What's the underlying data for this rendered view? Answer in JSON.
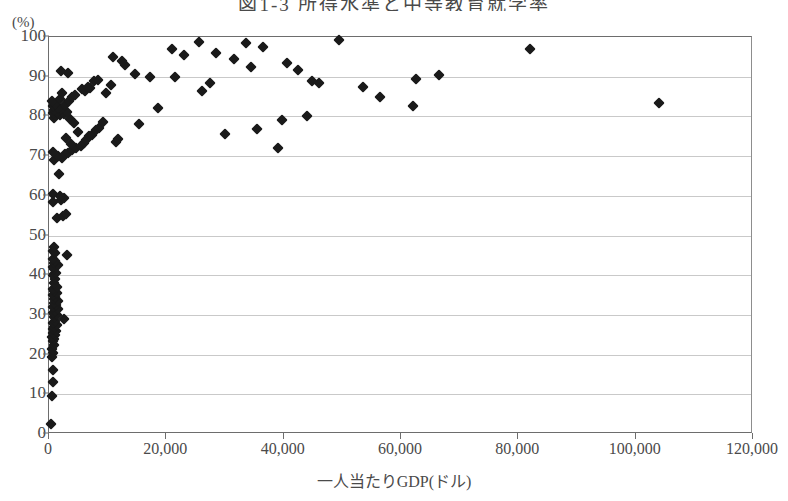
{
  "chart_data": {
    "type": "scatter",
    "title": "図1-3 所得水準と中等教育就学率",
    "xlabel": "一人当たりGDP(ドル)",
    "ylabel": "",
    "y_unit_label": "(%)",
    "xlim": [
      0,
      120000
    ],
    "ylim": [
      0,
      100
    ],
    "xticks": [
      0,
      20000,
      40000,
      60000,
      80000,
      100000,
      120000
    ],
    "xticklabels": [
      "0",
      "20,000",
      "40,000",
      "60,000",
      "80,000",
      "100,000",
      "120,000"
    ],
    "yticks": [
      0,
      10,
      20,
      30,
      40,
      50,
      60,
      70,
      80,
      90,
      100
    ],
    "yticklabels": [
      "0",
      "10",
      "20",
      "30",
      "40",
      "50",
      "60",
      "70",
      "80",
      "90",
      "100"
    ],
    "grid": "horizontal",
    "legend": "none",
    "marker": "diamond",
    "marker_color": "#1a1a1a",
    "gridline_color": "#c9c9c9",
    "axis_color": "#6d6d6d",
    "background_color": "#ffffff",
    "points": [
      [
        400,
        2.5
      ],
      [
        500,
        9.5
      ],
      [
        600,
        13.0
      ],
      [
        700,
        16.0
      ],
      [
        500,
        19.5
      ],
      [
        700,
        20.5
      ],
      [
        500,
        21.5
      ],
      [
        900,
        22.5
      ],
      [
        600,
        23.5
      ],
      [
        800,
        24.0
      ],
      [
        500,
        24.5
      ],
      [
        1000,
        25.0
      ],
      [
        700,
        25.5
      ],
      [
        1200,
        26.0
      ],
      [
        600,
        26.5
      ],
      [
        900,
        27.0
      ],
      [
        1400,
        27.5
      ],
      [
        700,
        28.0
      ],
      [
        1100,
        28.5
      ],
      [
        2600,
        29.0
      ],
      [
        800,
        29.5
      ],
      [
        1300,
        30.0
      ],
      [
        600,
        30.5
      ],
      [
        1000,
        31.0
      ],
      [
        1500,
        31.5
      ],
      [
        700,
        32.0
      ],
      [
        1200,
        32.5
      ],
      [
        900,
        33.0
      ],
      [
        1600,
        33.5
      ],
      [
        800,
        34.0
      ],
      [
        1100,
        34.5
      ],
      [
        600,
        35.0
      ],
      [
        1300,
        35.5
      ],
      [
        900,
        36.0
      ],
      [
        700,
        36.5
      ],
      [
        1400,
        37.0
      ],
      [
        800,
        38.0
      ],
      [
        1000,
        39.0
      ],
      [
        600,
        40.0
      ],
      [
        1200,
        40.5
      ],
      [
        900,
        41.5
      ],
      [
        700,
        42.0
      ],
      [
        1500,
        42.5
      ],
      [
        800,
        43.0
      ],
      [
        1100,
        43.5
      ],
      [
        600,
        44.0
      ],
      [
        3000,
        45.0
      ],
      [
        1000,
        45.5
      ],
      [
        700,
        46.0
      ],
      [
        900,
        47.0
      ],
      [
        1400,
        54.5
      ],
      [
        2400,
        55.0
      ],
      [
        2900,
        55.5
      ],
      [
        700,
        58.5
      ],
      [
        2000,
        59.0
      ],
      [
        2500,
        59.5
      ],
      [
        1800,
        60.0
      ],
      [
        600,
        60.5
      ],
      [
        1700,
        65.5
      ],
      [
        900,
        69.0
      ],
      [
        2200,
        69.5
      ],
      [
        1500,
        70.0
      ],
      [
        2700,
        70.5
      ],
      [
        3300,
        70.8
      ],
      [
        700,
        71.0
      ],
      [
        4000,
        71.5
      ],
      [
        4600,
        72.0
      ],
      [
        39000,
        72.0
      ],
      [
        5400,
        72.5
      ],
      [
        3700,
        73.0
      ],
      [
        5900,
        73.2
      ],
      [
        11400,
        73.5
      ],
      [
        6300,
        74.0
      ],
      [
        11800,
        74.3
      ],
      [
        2900,
        74.5
      ],
      [
        6800,
        75.0
      ],
      [
        7300,
        75.3
      ],
      [
        30000,
        75.5
      ],
      [
        5000,
        76.0
      ],
      [
        8000,
        76.5
      ],
      [
        35500,
        76.8
      ],
      [
        8600,
        77.0
      ],
      [
        15300,
        78.0
      ],
      [
        4300,
        78.3
      ],
      [
        9200,
        78.5
      ],
      [
        39800,
        79.0
      ],
      [
        3500,
        79.3
      ],
      [
        800,
        79.5
      ],
      [
        44000,
        80.0
      ],
      [
        1900,
        80.3
      ],
      [
        2600,
        80.5
      ],
      [
        600,
        80.8
      ],
      [
        1300,
        81.0
      ],
      [
        3100,
        81.2
      ],
      [
        900,
        81.5
      ],
      [
        2100,
        81.8
      ],
      [
        1600,
        82.0
      ],
      [
        18500,
        82.2
      ],
      [
        700,
        82.5
      ],
      [
        62000,
        82.5
      ],
      [
        2800,
        82.8
      ],
      [
        1100,
        83.0
      ],
      [
        104000,
        83.5
      ],
      [
        500,
        83.8
      ],
      [
        3400,
        84.0
      ],
      [
        1800,
        84.3
      ],
      [
        3900,
        85.0
      ],
      [
        56500,
        85.0
      ],
      [
        4400,
        85.5
      ],
      [
        2300,
        85.8
      ],
      [
        9800,
        86.0
      ],
      [
        6100,
        86.3
      ],
      [
        26000,
        86.5
      ],
      [
        5600,
        87.0
      ],
      [
        7000,
        87.2
      ],
      [
        53500,
        87.3
      ],
      [
        6600,
        87.5
      ],
      [
        10500,
        88.0
      ],
      [
        27500,
        88.3
      ],
      [
        46000,
        88.5
      ],
      [
        7600,
        88.8
      ],
      [
        44800,
        89.0
      ],
      [
        8300,
        89.2
      ],
      [
        62500,
        89.5
      ],
      [
        21500,
        89.8
      ],
      [
        17200,
        90.0
      ],
      [
        66500,
        90.5
      ],
      [
        14600,
        90.8
      ],
      [
        3200,
        91.0
      ],
      [
        2000,
        91.5
      ],
      [
        42500,
        91.8
      ],
      [
        34500,
        92.5
      ],
      [
        12900,
        93.0
      ],
      [
        40500,
        93.5
      ],
      [
        12500,
        94.0
      ],
      [
        31500,
        94.5
      ],
      [
        10900,
        95.0
      ],
      [
        23000,
        95.5
      ],
      [
        28500,
        96.0
      ],
      [
        21000,
        97.0
      ],
      [
        82000,
        97.0
      ],
      [
        36500,
        97.5
      ],
      [
        33500,
        98.5
      ],
      [
        25500,
        98.8
      ],
      [
        49500,
        99.3
      ]
    ]
  }
}
